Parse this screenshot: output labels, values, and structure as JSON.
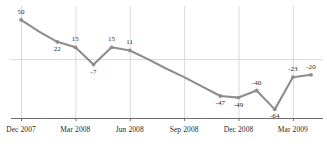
{
  "chart_data": {
    "type": "line",
    "title": "",
    "subtitle": "",
    "xlabel": "",
    "ylabel": "",
    "grid": "vertical-quarterly-plus-zero-line",
    "legend": "none",
    "ylim": [
      -75,
      60
    ],
    "xlim": [
      "Dec 2007",
      "Apr 2009"
    ],
    "zero_line": 0,
    "line_color": "#8d8d8d",
    "marker_color": "#8d8d8d",
    "grid_color": "#cfcfcf",
    "axis_color": "#6f6f6f",
    "text_color": "#2b2b2b",
    "x": [
      "Dec 2007",
      "Jan 2008",
      "Feb 2008",
      "Mar 2008",
      "Apr 2008",
      "May 2008",
      "Jun 2008",
      "Jul 2008",
      "Aug 2008",
      "Sep 2008",
      "Oct 2008",
      "Nov 2008",
      "Dec 2008",
      "Jan 2009",
      "Feb 2009",
      "Mar 2009",
      "Apr 2009"
    ],
    "values": [
      50,
      35,
      22,
      15,
      -7,
      15,
      11,
      0,
      -12,
      -23,
      -35,
      -47,
      -49,
      -40,
      -64,
      -23,
      -20
    ],
    "point_labels": [
      "50",
      "",
      "22",
      "15",
      "-7",
      "15",
      "11",
      "",
      "",
      "",
      "",
      "-47",
      "-49",
      "-40",
      "-64",
      "-23",
      "-20"
    ],
    "label_positions": [
      "above",
      "",
      "below",
      "above",
      "below",
      "above",
      "above",
      "",
      "",
      "",
      "",
      "below",
      "below",
      "above",
      "below",
      "above",
      "above"
    ],
    "tick_labels": [
      "Dec 2007",
      "Mar 2008",
      "Jun 2008",
      "Sep 2008",
      "Dec 2008",
      "Mar 2009"
    ],
    "tick_index": [
      0,
      3,
      6,
      9,
      12,
      15
    ]
  }
}
